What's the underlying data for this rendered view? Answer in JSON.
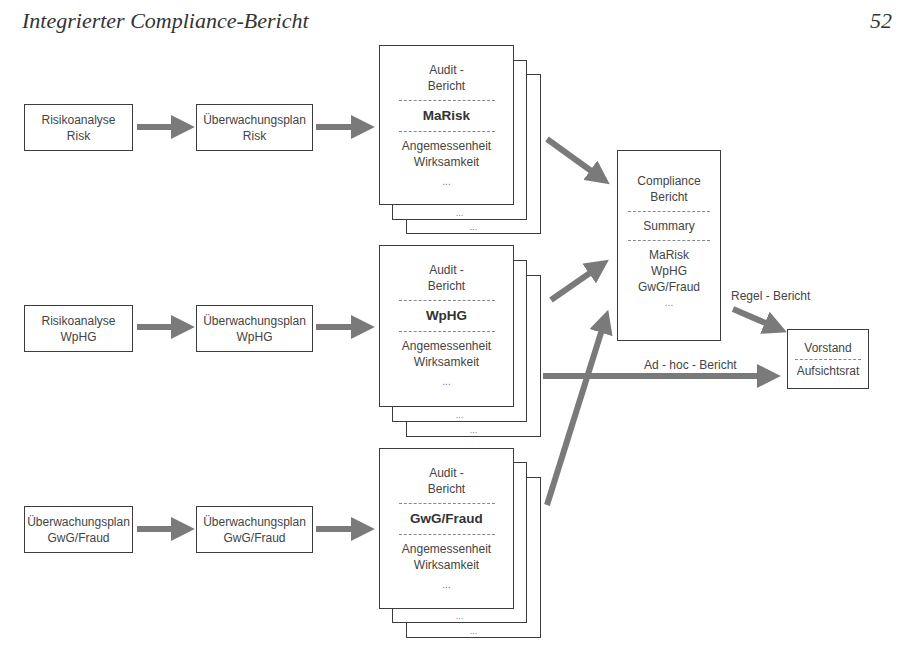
{
  "header": {
    "title": "Integrierter Compliance-Bericht",
    "page_number": "52"
  },
  "rows": [
    {
      "input": {
        "line1": "Risikoanalyse",
        "line2": "Risk"
      },
      "plan": {
        "line1": "Überwachungsplan",
        "line2": "Risk"
      },
      "audit": {
        "line1": "Audit -",
        "line2": "Bericht",
        "topic": "MaRisk",
        "line3": "Angemessenheit",
        "line4": "Wirksamkeit",
        "dots": "..."
      }
    },
    {
      "input": {
        "line1": "Risikoanalyse",
        "line2": "WpHG"
      },
      "plan": {
        "line1": "Überwachungsplan",
        "line2": "WpHG"
      },
      "audit": {
        "line1": "Audit -",
        "line2": "Bericht",
        "topic": "WpHG",
        "line3": "Angemessenheit",
        "line4": "Wirksamkeit",
        "dots": "..."
      }
    },
    {
      "input": {
        "line1": "Überwachungsplan",
        "line2": "GwG/Fraud"
      },
      "plan": {
        "line1": "Überwachungsplan",
        "line2": "GwG/Fraud"
      },
      "audit": {
        "line1": "Audit -",
        "line2": "Bericht",
        "topic": "GwG/Fraud",
        "line3": "Angemessenheit",
        "line4": "Wirksamkeit",
        "dots": "..."
      }
    }
  ],
  "compliance": {
    "line1": "Compliance",
    "line2": "Bericht",
    "summary": "Summary",
    "items": [
      "MaRisk",
      "WpHG",
      "GwG/Fraud",
      "..."
    ]
  },
  "recipient": {
    "line1": "Vorstand",
    "line2": "Aufsichtsrat"
  },
  "labels": {
    "regular": "Regel - Bericht",
    "adhoc": "Ad - hoc - Bericht"
  },
  "sheet_dots": "...",
  "colors": {
    "arrow": "#7a7a7a",
    "border": "#3c3c3c"
  }
}
